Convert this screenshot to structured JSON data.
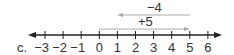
{
  "part_label": "c.",
  "number_line": {
    "min": -3,
    "max": 6,
    "ticks": [
      "−3",
      "−2",
      "−1",
      "0",
      "1",
      "2",
      "3",
      "4",
      "5",
      "6"
    ],
    "line_color": "#222222"
  },
  "arrows": [
    {
      "label": "+5",
      "from": 0,
      "to": 5,
      "color": "#aaaaaa"
    },
    {
      "label": "−4",
      "from": 5,
      "to": 1,
      "color": "#aaaaaa"
    }
  ]
}
